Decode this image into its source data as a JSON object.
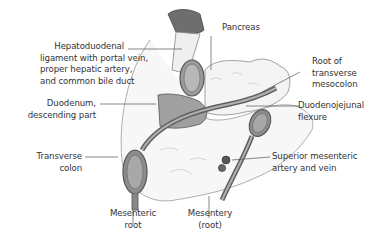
{
  "figure": {
    "colors": {
      "background": "#ffffff",
      "outline": "#555555",
      "tissue_light": "#f2f2f2",
      "tissue_mid": "#a8a8a8",
      "tissue_dark": "#6e6e6e",
      "leader_line": "#555555",
      "text": "#333333"
    },
    "labels": {
      "hepatoduodenal": {
        "line1": "Hepatoduodenal",
        "line2": "ligament with portal vein,",
        "line3": "proper hepatic artery,",
        "line4": "and common bile duct"
      },
      "duodenum": {
        "line1": "Duodenum,",
        "line2": "descending part"
      },
      "transverse_colon": {
        "line1": "Transverse",
        "line2": "colon"
      },
      "mesenteric_root": {
        "line1": "Mesenteric",
        "line2": "root"
      },
      "mesentery": {
        "line1": "Mesentery",
        "line2": "(root)"
      },
      "pancreas": {
        "line1": "Pancreas"
      },
      "root_transverse_mesocolon": {
        "line1": "Root of",
        "line2": "transverse",
        "line3": "mesocolon"
      },
      "duodenojejunal": {
        "line1": "Duodenojejunal",
        "line2": "flexure"
      },
      "sma": {
        "line1": "Superior mesenteric",
        "line2": "artery and vein"
      }
    }
  }
}
